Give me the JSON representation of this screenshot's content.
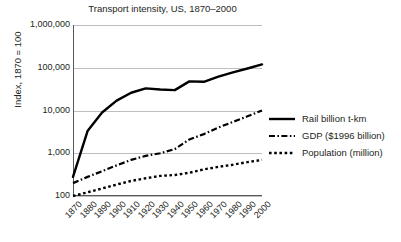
{
  "chart_data": {
    "type": "line",
    "title": "Transport intensity, US, 1870–2000",
    "xlabel": "",
    "ylabel": "Index, 1870 = 100",
    "yscale": "log",
    "ylim": [
      100,
      1000000
    ],
    "ytick_labels": [
      "1,000,000",
      "100,000",
      "10,000",
      "1,000",
      "100"
    ],
    "ytick_values": [
      1000000,
      100000,
      10000,
      1000,
      100
    ],
    "grid": "horizontal",
    "legend_position": "right",
    "categories": [
      "1870",
      "1880",
      "1890",
      "1900",
      "1910",
      "1920",
      "1930",
      "1940",
      "1950",
      "1960",
      "1970",
      "1980",
      "1990",
      "2000"
    ],
    "x": [
      1870,
      1880,
      1890,
      1900,
      1910,
      1920,
      1930,
      1940,
      1950,
      1960,
      1970,
      1980,
      1990,
      2000
    ],
    "series": [
      {
        "name": "Rail billion t-km",
        "style": "solid",
        "values": [
          280,
          3300,
          9000,
          17000,
          26000,
          33000,
          31000,
          30000,
          48000,
          47000,
          62000,
          78000,
          96000,
          120000
        ]
      },
      {
        "name": "GDP ($1996 billion)",
        "style": "dash-dot",
        "values": [
          200,
          280,
          380,
          520,
          700,
          870,
          1000,
          1250,
          2100,
          2800,
          4000,
          5400,
          7300,
          10000
        ]
      },
      {
        "name": "Population (million)",
        "style": "dotted",
        "values": [
          100,
          122,
          150,
          185,
          225,
          260,
          295,
          310,
          350,
          420,
          480,
          540,
          620,
          700
        ]
      }
    ]
  },
  "legend": {
    "items": [
      {
        "label": "Rail billion t-km",
        "style": "solid"
      },
      {
        "label": "GDP ($1996 billion)",
        "style": "dash-dot"
      },
      {
        "label": "Population (million)",
        "style": "dotted"
      }
    ]
  },
  "colors": {
    "line": "#000000",
    "grid": "#bcbec0",
    "axis": "#58595b",
    "text": "#231f20",
    "background": "#ffffff"
  }
}
